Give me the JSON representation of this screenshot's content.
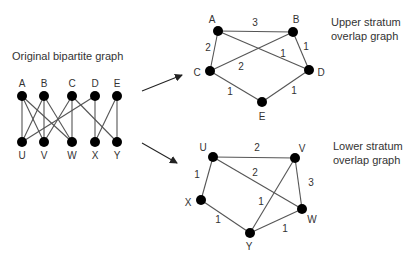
{
  "colors": {
    "node": "#000000",
    "edge": "#555555",
    "text": "#333333",
    "background": "#ffffff"
  },
  "bipartite": {
    "title": "Original bipartite graph",
    "title_pos": [
      12,
      60
    ],
    "upper_nodes": [
      {
        "id": "A",
        "x": 22,
        "y": 96
      },
      {
        "id": "B",
        "x": 44,
        "y": 96
      },
      {
        "id": "C",
        "x": 72,
        "y": 96
      },
      {
        "id": "D",
        "x": 95,
        "y": 96
      },
      {
        "id": "E",
        "x": 117,
        "y": 96
      }
    ],
    "lower_nodes": [
      {
        "id": "U",
        "x": 22,
        "y": 142
      },
      {
        "id": "V",
        "x": 44,
        "y": 142
      },
      {
        "id": "W",
        "x": 72,
        "y": 142
      },
      {
        "id": "X",
        "x": 95,
        "y": 142
      },
      {
        "id": "Y",
        "x": 117,
        "y": 142
      }
    ],
    "edges": [
      [
        "A",
        "U"
      ],
      [
        "A",
        "V"
      ],
      [
        "A",
        "W"
      ],
      [
        "B",
        "U"
      ],
      [
        "B",
        "V"
      ],
      [
        "B",
        "W"
      ],
      [
        "C",
        "V"
      ],
      [
        "C",
        "W"
      ],
      [
        "C",
        "Y"
      ],
      [
        "D",
        "U"
      ],
      [
        "D",
        "X"
      ],
      [
        "E",
        "X"
      ],
      [
        "E",
        "Y"
      ]
    ]
  },
  "arrows": [
    {
      "from": [
        142,
        91
      ],
      "to": [
        182,
        75
      ]
    },
    {
      "from": [
        142,
        143
      ],
      "to": [
        177,
        163
      ]
    }
  ],
  "upper_overlap": {
    "caption_lines": [
      "Upper stratum",
      "overlap graph"
    ],
    "caption_pos": [
      331,
      26
    ],
    "nodes": [
      {
        "id": "A",
        "x": 218,
        "y": 31,
        "lx": 212,
        "ly": 20
      },
      {
        "id": "B",
        "x": 293,
        "y": 32,
        "lx": 296,
        "ly": 20
      },
      {
        "id": "C",
        "x": 210,
        "y": 71,
        "lx": 197,
        "ly": 73
      },
      {
        "id": "D",
        "x": 309,
        "y": 70,
        "lx": 321,
        "ly": 73
      },
      {
        "id": "E",
        "x": 262,
        "y": 102,
        "lx": 262,
        "ly": 117
      }
    ],
    "edges": [
      {
        "a": "A",
        "b": "B",
        "w": "3",
        "lx": 255,
        "ly": 23
      },
      {
        "a": "A",
        "b": "C",
        "w": "2",
        "lx": 208,
        "ly": 48
      },
      {
        "a": "A",
        "b": "D",
        "w": "1",
        "lx": 283,
        "ly": 54
      },
      {
        "a": "B",
        "b": "D",
        "w": "1",
        "lx": 306,
        "ly": 47
      },
      {
        "a": "B",
        "b": "C",
        "w": "2",
        "lx": 241,
        "ly": 67
      },
      {
        "a": "C",
        "b": "E",
        "w": "1",
        "lx": 230,
        "ly": 92
      },
      {
        "a": "D",
        "b": "E",
        "w": "1",
        "lx": 294,
        "ly": 91
      }
    ]
  },
  "lower_overlap": {
    "caption_lines": [
      "Lower stratum",
      "overlap graph"
    ],
    "caption_pos": [
      333,
      150
    ],
    "nodes": [
      {
        "id": "U",
        "x": 213,
        "y": 157,
        "lx": 203,
        "ly": 148
      },
      {
        "id": "V",
        "x": 295,
        "y": 158,
        "lx": 302,
        "ly": 149
      },
      {
        "id": "W",
        "x": 302,
        "y": 209,
        "lx": 312,
        "ly": 220
      },
      {
        "id": "X",
        "x": 201,
        "y": 200,
        "lx": 188,
        "ly": 203
      },
      {
        "id": "Y",
        "x": 250,
        "y": 233,
        "lx": 249,
        "ly": 247
      }
    ],
    "edges": [
      {
        "a": "U",
        "b": "V",
        "w": "2",
        "lx": 257,
        "ly": 148
      },
      {
        "a": "U",
        "b": "W",
        "w": "2",
        "lx": 255,
        "ly": 173
      },
      {
        "a": "V",
        "b": "W",
        "w": "3",
        "lx": 311,
        "ly": 183
      },
      {
        "a": "U",
        "b": "X",
        "w": "1",
        "lx": 197,
        "ly": 175
      },
      {
        "a": "V",
        "b": "Y",
        "w": "1",
        "lx": 261,
        "ly": 202
      },
      {
        "a": "X",
        "b": "Y",
        "w": "1",
        "lx": 218,
        "ly": 220
      },
      {
        "a": "W",
        "b": "Y",
        "w": "1",
        "lx": 285,
        "ly": 229
      }
    ]
  }
}
